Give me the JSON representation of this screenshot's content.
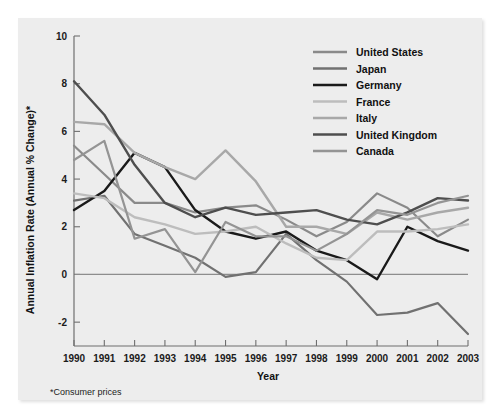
{
  "figure": {
    "background": "#ededed",
    "footnote": "*Consumer prices"
  },
  "chart_data": {
    "type": "line",
    "title": "",
    "xlabel": "Year",
    "ylabel": "Annual Inflation Rate (Annual % Change)*",
    "x": [
      1990,
      1991,
      1992,
      1993,
      1994,
      1995,
      1996,
      1997,
      1998,
      1999,
      2000,
      2001,
      2002,
      2003
    ],
    "categories": [
      "1990",
      "1991",
      "1992",
      "1993",
      "1994",
      "1995",
      "1996",
      "1997",
      "1998",
      "1999",
      "2000",
      "2001",
      "2002",
      "2003"
    ],
    "xlim": [
      1990,
      2003
    ],
    "ylim": [
      -3,
      10
    ],
    "yticks": [
      -2,
      0,
      2,
      4,
      6,
      8,
      10
    ],
    "ytick_labels": [
      "-2",
      "0",
      "2",
      "4",
      "6",
      "8",
      "10"
    ],
    "grid": false,
    "legend_position": "top-right",
    "zero_line": 0,
    "series": [
      {
        "name": "United States",
        "color": "#8a8a8a",
        "width": 2.2,
        "values": [
          5.4,
          4.2,
          3.0,
          3.0,
          2.6,
          2.8,
          2.9,
          2.3,
          1.6,
          2.2,
          3.4,
          2.8,
          1.6,
          2.3
        ]
      },
      {
        "name": "Japan",
        "color": "#717171",
        "width": 2.2,
        "values": [
          3.1,
          3.3,
          1.7,
          1.2,
          0.7,
          -0.1,
          0.1,
          1.7,
          0.6,
          -0.3,
          -1.7,
          -1.6,
          -1.2,
          -2.5
        ]
      },
      {
        "name": "Germany",
        "color": "#1a1a1a",
        "width": 2.4,
        "values": [
          2.7,
          3.5,
          5.1,
          4.5,
          2.7,
          1.8,
          1.5,
          1.8,
          1.0,
          0.6,
          -0.2,
          2.0,
          1.4,
          1.0
        ]
      },
      {
        "name": "France",
        "color": "#bdbdbd",
        "width": 2.4,
        "values": [
          3.4,
          3.2,
          2.4,
          2.1,
          1.7,
          1.8,
          2.0,
          1.3,
          0.7,
          0.6,
          1.8,
          1.8,
          1.9,
          2.1
        ]
      },
      {
        "name": "Italy",
        "color": "#a8a8a8",
        "width": 2.4,
        "values": [
          6.4,
          6.3,
          5.1,
          4.5,
          4.0,
          5.2,
          3.9,
          2.0,
          2.0,
          1.7,
          2.6,
          2.3,
          2.6,
          2.8
        ]
      },
      {
        "name": "United Kingdom",
        "color": "#4e4e4e",
        "width": 2.4,
        "values": [
          8.1,
          6.7,
          4.6,
          3.0,
          2.4,
          2.8,
          2.5,
          2.6,
          2.7,
          2.3,
          2.1,
          2.6,
          3.2,
          3.1
        ]
      },
      {
        "name": "Canada",
        "color": "#949494",
        "width": 2.2,
        "values": [
          4.8,
          5.6,
          1.5,
          1.9,
          0.1,
          2.2,
          1.6,
          1.6,
          1.0,
          1.7,
          2.7,
          2.5,
          3.0,
          3.3
        ]
      }
    ]
  }
}
